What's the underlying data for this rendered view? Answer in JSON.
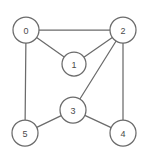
{
  "graph": {
    "title": "undirected-graph-diagram",
    "background_color": "#ffffff",
    "stroke_color": "#6b6b6b",
    "node_fill_color": "#ffffff",
    "label_color": "#4a4a4a",
    "node_radius": 13,
    "nodes": [
      {
        "id": "0",
        "label": "0",
        "cx": 26,
        "cy": 30,
        "r": 13
      },
      {
        "id": "1",
        "label": "1",
        "cx": 74,
        "cy": 64,
        "r": 12
      },
      {
        "id": "2",
        "label": "2",
        "cx": 123,
        "cy": 30,
        "r": 13
      },
      {
        "id": "3",
        "label": "3",
        "cx": 73,
        "cy": 110,
        "r": 13
      },
      {
        "id": "4",
        "label": "4",
        "cx": 123,
        "cy": 133,
        "r": 13
      },
      {
        "id": "5",
        "label": "5",
        "cx": 25,
        "cy": 133,
        "r": 13
      }
    ],
    "edges": [
      {
        "from": "0",
        "to": "2"
      },
      {
        "from": "0",
        "to": "1"
      },
      {
        "from": "0",
        "to": "5"
      },
      {
        "from": "1",
        "to": "2"
      },
      {
        "from": "2",
        "to": "3"
      },
      {
        "from": "2",
        "to": "4"
      },
      {
        "from": "3",
        "to": "5"
      },
      {
        "from": "3",
        "to": "4"
      }
    ]
  }
}
